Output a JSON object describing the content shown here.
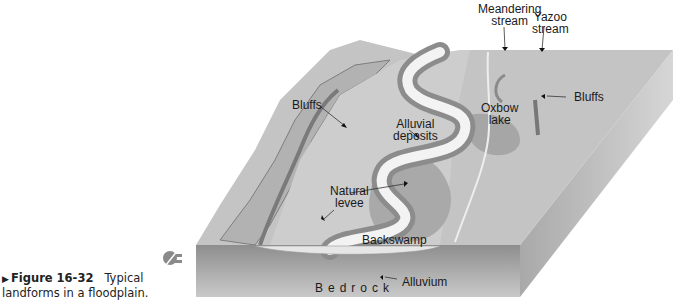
{
  "caption": {
    "marker": "▶",
    "figure_number": "Figure 16-32",
    "text": "Typical landforms in a floodplain."
  },
  "labels": {
    "meandering_stream": [
      "Meandering",
      "stream"
    ],
    "yazoo_stream": [
      "Yazoo",
      "stream"
    ],
    "bluffs_left": "Bluffs",
    "bluffs_right": "Bluffs",
    "oxbow_lake": [
      "Oxbow",
      "lake"
    ],
    "alluvial_deposits": [
      "Alluvial",
      "deposits"
    ],
    "natural_levee": [
      "Natural",
      "levee"
    ],
    "backswamp": "Backswamp",
    "alluvium": "Alluvium",
    "bedrock": "Bedrock"
  },
  "colors": {
    "upland": "#bdbdbd",
    "floodplain": "#c9c9c9",
    "river": "#f2f2f2",
    "levee": "#8f8f8f",
    "backswamp": "#a8a8a8",
    "bluff_edge": "#7a7a7a",
    "side_face_top": "#9a9a9a",
    "side_face_bottom": "#c8c8c8",
    "alluvium": "#e4e4e4"
  }
}
